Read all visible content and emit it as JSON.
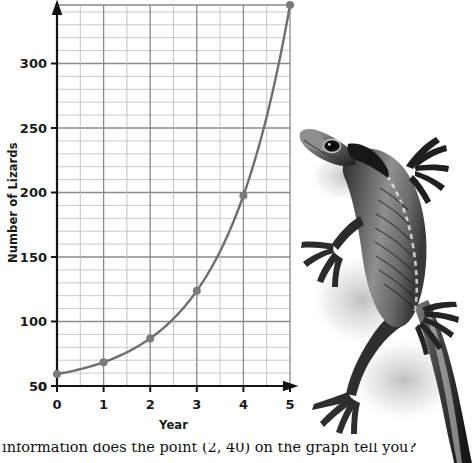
{
  "chart_data": {
    "type": "line",
    "title": "",
    "xlabel": "Year",
    "ylabel": "Number of Lizards",
    "x": [
      0,
      1,
      2,
      3,
      4,
      5
    ],
    "values": [
      10,
      20,
      40,
      80,
      160,
      320
    ],
    "series": [
      {
        "name": "Number of Lizards",
        "x": [
          0,
          1,
          2,
          3,
          4,
          5
        ],
        "values": [
          10,
          20,
          40,
          80,
          160,
          320
        ]
      }
    ],
    "xlim": [
      0,
      5
    ],
    "ylim": [
      0,
      320
    ],
    "x_ticks": [
      "0",
      "1",
      "2",
      "3",
      "4",
      "5"
    ],
    "y_ticks": [
      "0",
      "50",
      "100",
      "150",
      "200",
      "250",
      "300"
    ],
    "x_minor_step": 0.5,
    "y_minor_step": 10,
    "grid": true,
    "legend": "none",
    "markers": true,
    "line_color": "#6e6e6e",
    "marker_color": "#7a7a7a",
    "grid_major_color": "#8c8c8c",
    "grid_minor_color": "#b9b9b9",
    "axis_color": "#1a1a1a"
  },
  "axes": {
    "y_title": "Number of Lizards",
    "x_title": "Year",
    "y_tick_labels": [
      "300",
      "250",
      "200",
      "150",
      "100",
      "50",
      "0"
    ],
    "x_tick_labels": [
      "0",
      "1",
      "2",
      "3",
      "4",
      "5"
    ]
  },
  "photo": {
    "alt_name": "lizard-photograph",
    "subject": "lizard",
    "style": "grayscale-photo"
  },
  "caption": {
    "text": "information does the point (2, 40) on the graph tell you?"
  }
}
